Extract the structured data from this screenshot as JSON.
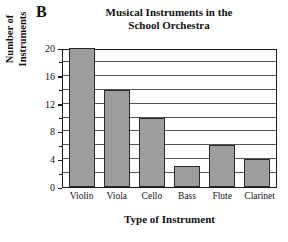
{
  "panel": {
    "letter": "B"
  },
  "chart_data": {
    "type": "bar",
    "title": "Musical Instruments in the School Orchestra",
    "title_lines": [
      "Musical Instruments in the",
      "School Orchestra"
    ],
    "categories": [
      "Violin",
      "Viola",
      "Cello",
      "Bass",
      "Flute",
      "Clarinet"
    ],
    "values": [
      20,
      14,
      10,
      3,
      6,
      4
    ],
    "xlabel": "Type of Instrument",
    "ylabel": "Number of Instruments",
    "ylabel_lines": [
      "Number of",
      "Instruments"
    ],
    "ylim": [
      0,
      20
    ],
    "ytick_labels": [
      "0",
      "4",
      "8",
      "12",
      "16",
      "20"
    ],
    "ytick_values": [
      0,
      4,
      8,
      12,
      16,
      20
    ],
    "yminor_tick_values": [
      2,
      6,
      10,
      14,
      18
    ],
    "gridline_values": [
      2,
      4,
      6,
      8,
      10,
      12,
      14,
      16,
      18
    ],
    "grid": true,
    "legend": null,
    "colors": {
      "bar_fill": "#9d9d9d",
      "bar_border": "#2a2a2a",
      "frame": "#1a1a1a",
      "gridline": "#555555",
      "text": "#111111",
      "background": "#ffffff"
    }
  }
}
